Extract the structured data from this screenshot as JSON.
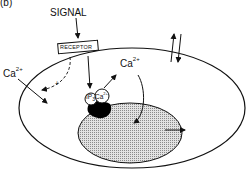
{
  "figure": {
    "panel_label": "(b)",
    "signal_label": "SIGNAL",
    "receptor_label": "RECEPTOR",
    "calcium_label": "Ca",
    "calcium_charge": "2+",
    "ip3_label": "IP",
    "ip3_subscript": "3",
    "plus_sign": "+",
    "colors": {
      "line": "#111111",
      "nucleus_fill": "#cfcfcf",
      "channel_fill": "#000000",
      "background": "#ffffff"
    }
  }
}
